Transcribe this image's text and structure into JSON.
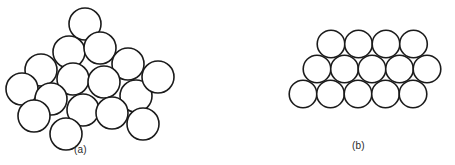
{
  "figure": {
    "background_color": "#ffffff",
    "stroke_color": "#1b1b1b",
    "fill_color": "#ffffff",
    "width": 455,
    "height": 165
  },
  "panels": [
    {
      "id": "a",
      "caption": "(a)",
      "caption_x": 74,
      "caption_y": 144,
      "description": "disordered rotated close-packed circle cluster",
      "circle_radius": 16,
      "stroke_width": 1.6,
      "circles": [
        {
          "cx": 85,
          "cy": 24
        },
        {
          "cx": 69,
          "cy": 52
        },
        {
          "cx": 100,
          "cy": 48
        },
        {
          "cx": 41,
          "cy": 70
        },
        {
          "cx": 73,
          "cy": 79
        },
        {
          "cx": 128,
          "cy": 64
        },
        {
          "cx": 22,
          "cy": 89
        },
        {
          "cx": 51,
          "cy": 99
        },
        {
          "cx": 104,
          "cy": 82
        },
        {
          "cx": 136,
          "cy": 96
        },
        {
          "cx": 158,
          "cy": 77
        },
        {
          "cx": 34,
          "cy": 116
        },
        {
          "cx": 83,
          "cy": 110
        },
        {
          "cx": 112,
          "cy": 113
        },
        {
          "cx": 66,
          "cy": 134
        },
        {
          "cx": 143,
          "cy": 124
        }
      ]
    },
    {
      "id": "b",
      "caption": "(b)",
      "caption_x": 352,
      "caption_y": 140,
      "description": "ordered hexagonal close-packed circle array, three rows",
      "circle_radius": 13.8,
      "stroke_width": 1.6,
      "rows": [
        {
          "label": "top-row",
          "count": 4,
          "cy": 44,
          "cx_start": 331,
          "cx_step": 27.5
        },
        {
          "label": "middle-row",
          "count": 5,
          "cy": 69,
          "cx_start": 317,
          "cx_step": 27.5
        },
        {
          "label": "bottom-row",
          "count": 5,
          "cy": 94,
          "cx_start": 303,
          "cx_step": 27.5
        }
      ],
      "circles": [
        {
          "cx": 331,
          "cy": 44
        },
        {
          "cx": 358.5,
          "cy": 44
        },
        {
          "cx": 386,
          "cy": 44
        },
        {
          "cx": 413.5,
          "cy": 44
        },
        {
          "cx": 317,
          "cy": 69
        },
        {
          "cx": 344.5,
          "cy": 69
        },
        {
          "cx": 372,
          "cy": 69
        },
        {
          "cx": 399.5,
          "cy": 69
        },
        {
          "cx": 427,
          "cy": 69
        },
        {
          "cx": 303,
          "cy": 94
        },
        {
          "cx": 330.5,
          "cy": 94
        },
        {
          "cx": 358,
          "cy": 94
        },
        {
          "cx": 385.5,
          "cy": 94
        },
        {
          "cx": 413,
          "cy": 94
        }
      ]
    }
  ]
}
